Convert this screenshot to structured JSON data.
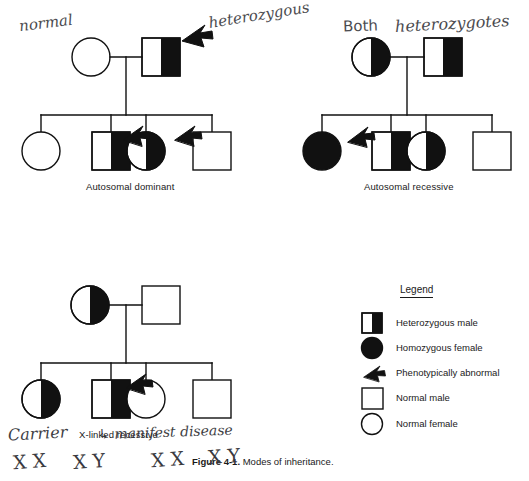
{
  "figure": {
    "caption_bold": "Figure 4-1.",
    "caption_rest": "Modes of inheritance."
  },
  "panels": [
    {
      "id": "autosomal-dominant",
      "label": "Autosomal dominant",
      "parents": [
        {
          "shape": "circle",
          "fill": "none",
          "role": "normal-female-parent"
        },
        {
          "shape": "square",
          "fill": "half",
          "role": "heterozygous-male-parent"
        }
      ],
      "children": [
        {
          "shape": "circle",
          "fill": "none",
          "role": "normal-female-child"
        },
        {
          "shape": "square",
          "fill": "half",
          "role": "heterozygous-male-child",
          "arrow": true
        },
        {
          "shape": "circle",
          "fill": "half",
          "role": "heterozygous-female-child",
          "arrow": true
        },
        {
          "shape": "square",
          "fill": "none",
          "role": "normal-male-child"
        }
      ]
    },
    {
      "id": "autosomal-recessive",
      "label": "Autosomal recessive",
      "parents": [
        {
          "shape": "circle",
          "fill": "half",
          "role": "heterozygous-female-parent"
        },
        {
          "shape": "square",
          "fill": "half",
          "role": "heterozygous-male-parent"
        }
      ],
      "children": [
        {
          "shape": "circle",
          "fill": "full",
          "role": "homozygous-female-child",
          "arrow": true
        },
        {
          "shape": "square",
          "fill": "half",
          "role": "heterozygous-male-child"
        },
        {
          "shape": "circle",
          "fill": "half",
          "role": "heterozygous-female-child"
        },
        {
          "shape": "square",
          "fill": "none",
          "role": "normal-male-child"
        }
      ]
    },
    {
      "id": "x-linked-recessive",
      "label": "X-linked recessive",
      "parents": [
        {
          "shape": "circle",
          "fill": "half",
          "role": "carrier-female-parent"
        },
        {
          "shape": "square",
          "fill": "none",
          "role": "normal-male-parent"
        }
      ],
      "children": [
        {
          "shape": "circle",
          "fill": "half",
          "role": "carrier-female-child"
        },
        {
          "shape": "square",
          "fill": "half",
          "role": "affected-male-child",
          "arrow": true
        },
        {
          "shape": "circle",
          "fill": "none",
          "role": "normal-female-child"
        },
        {
          "shape": "square",
          "fill": "none",
          "role": "normal-male-child"
        }
      ]
    }
  ],
  "legend": {
    "title": "Legend",
    "items": [
      {
        "symbol": "half-filled-square",
        "label": "Heterozygous male"
      },
      {
        "symbol": "filled-circle",
        "label": "Homozygous female"
      },
      {
        "symbol": "arrow",
        "label": "Phenotypically abnormal"
      },
      {
        "symbol": "open-square",
        "label": "Normal male"
      },
      {
        "symbol": "open-circle",
        "label": "Normal female"
      }
    ]
  },
  "annotations": {
    "normal": "normal",
    "heterozygous": "heterozygous",
    "both": "Both",
    "heterozygotes": "heterozygotes",
    "carrier": "Carrier",
    "manifest_disease": "↳ manifest disease",
    "karyotypes": [
      "X X",
      "X Y",
      "X X",
      "X Y"
    ]
  },
  "colors": {
    "ink": "#111111",
    "pencil": "#3c3c42",
    "paper": "#ffffff"
  }
}
